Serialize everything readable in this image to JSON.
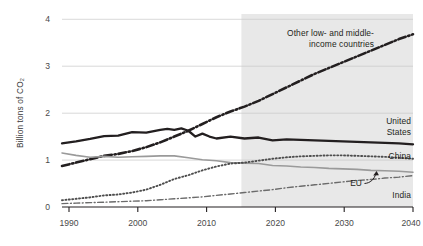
{
  "chart_data": {
    "type": "line",
    "title": "",
    "xlabel": "",
    "ylabel": "Billion tons of CO₂",
    "xlim": [
      1990,
      2040
    ],
    "ylim": [
      0,
      4
    ],
    "yticks": [
      0,
      1,
      2,
      3,
      4
    ],
    "ytick_labels": [
      "0",
      "1",
      "2",
      "3",
      "4"
    ],
    "xticks": [
      1990,
      2000,
      2010,
      2020,
      2030,
      2040
    ],
    "xtick_labels": [
      "1990",
      "2000",
      "2010",
      "2020",
      "2030",
      "2040"
    ],
    "grid": "horizontal",
    "legend_position": "inline-annotations",
    "forecast_start": 2017,
    "forecast_shading": "#e8e8e8",
    "series": [
      {
        "name": "Other low- and middle-income countries",
        "label_lines": [
          "Other low- and middle-",
          "income countries"
        ],
        "style": "dash-dot",
        "color": "#231f20",
        "width": 2.6,
        "x": [
          1990,
          1992,
          1994,
          1996,
          1998,
          2000,
          2002,
          2004,
          2006,
          2008,
          2010,
          2012,
          2014,
          2016,
          2018,
          2020,
          2022,
          2024,
          2026,
          2028,
          2030,
          2032,
          2034,
          2036,
          2038,
          2040
        ],
        "y": [
          0.85,
          0.92,
          0.99,
          1.06,
          1.1,
          1.16,
          1.24,
          1.34,
          1.46,
          1.58,
          1.72,
          1.86,
          1.98,
          2.08,
          2.2,
          2.34,
          2.48,
          2.62,
          2.76,
          2.88,
          3.0,
          3.12,
          3.24,
          3.36,
          3.48,
          3.58
        ]
      },
      {
        "name": "United States",
        "label_lines": [
          "United",
          "States"
        ],
        "style": "solid",
        "color": "#231f20",
        "width": 2.3,
        "x": [
          1990,
          1992,
          1994,
          1996,
          1998,
          2000,
          2002,
          2004,
          2005,
          2006,
          2007,
          2008,
          2009,
          2010,
          2011,
          2012,
          2014,
          2016,
          2018,
          2020,
          2022,
          2024,
          2026,
          2028,
          2030,
          2032,
          2034,
          2036,
          2038,
          2040
        ],
        "y": [
          1.32,
          1.36,
          1.41,
          1.47,
          1.48,
          1.55,
          1.54,
          1.6,
          1.62,
          1.6,
          1.63,
          1.58,
          1.46,
          1.52,
          1.46,
          1.42,
          1.46,
          1.42,
          1.44,
          1.38,
          1.4,
          1.39,
          1.38,
          1.37,
          1.36,
          1.35,
          1.34,
          1.33,
          1.32,
          1.3
        ]
      },
      {
        "name": "EU",
        "label_lines": [
          "EU"
        ],
        "style": "solid",
        "color": "#9a9a9a",
        "width": 1.6,
        "x": [
          1990,
          1992,
          1994,
          1996,
          1998,
          2000,
          2002,
          2004,
          2006,
          2008,
          2010,
          2012,
          2014,
          2016,
          2018,
          2020,
          2022,
          2024,
          2026,
          2028,
          2030,
          2032,
          2034,
          2036,
          2038,
          2040
        ],
        "y": [
          1.12,
          1.07,
          1.03,
          1.05,
          1.03,
          1.04,
          1.05,
          1.06,
          1.06,
          1.02,
          0.98,
          0.96,
          0.92,
          0.91,
          0.9,
          0.86,
          0.85,
          0.83,
          0.82,
          0.8,
          0.79,
          0.78,
          0.76,
          0.75,
          0.74,
          0.72
        ]
      },
      {
        "name": "China",
        "label_lines": [
          "China"
        ],
        "style": "dotted",
        "color": "#4d4d4d",
        "width": 1.9,
        "x": [
          1990,
          1992,
          1994,
          1996,
          1998,
          2000,
          2002,
          2004,
          2006,
          2008,
          2010,
          2012,
          2014,
          2016,
          2018,
          2020,
          2022,
          2024,
          2026,
          2028,
          2030,
          2032,
          2034,
          2036,
          2038,
          2040
        ],
        "y": [
          0.14,
          0.17,
          0.2,
          0.24,
          0.26,
          0.3,
          0.36,
          0.46,
          0.58,
          0.66,
          0.76,
          0.84,
          0.9,
          0.92,
          0.96,
          1.0,
          1.03,
          1.05,
          1.06,
          1.07,
          1.07,
          1.06,
          1.05,
          1.04,
          1.02,
          1.0
        ]
      },
      {
        "name": "India",
        "label_lines": [
          "India"
        ],
        "style": "thin-dash-dot",
        "color": "#6b6b6b",
        "width": 1.4,
        "x": [
          1990,
          1992,
          1994,
          1996,
          1998,
          2000,
          2002,
          2004,
          2006,
          2008,
          2010,
          2012,
          2014,
          2016,
          2018,
          2020,
          2022,
          2024,
          2026,
          2028,
          2030,
          2032,
          2034,
          2036,
          2038,
          2040
        ],
        "y": [
          0.07,
          0.08,
          0.09,
          0.1,
          0.11,
          0.12,
          0.13,
          0.15,
          0.17,
          0.19,
          0.21,
          0.24,
          0.27,
          0.3,
          0.33,
          0.36,
          0.4,
          0.43,
          0.46,
          0.49,
          0.52,
          0.55,
          0.57,
          0.6,
          0.62,
          0.65
        ]
      }
    ],
    "annotations": [
      {
        "id": "other-low-middle",
        "lines": [
          "Other low- and middle-",
          "income countries"
        ],
        "anchor": "end"
      },
      {
        "id": "united-states",
        "lines": [
          "United",
          "States"
        ],
        "anchor": "end"
      },
      {
        "id": "china",
        "lines": [
          "China"
        ],
        "anchor": "end"
      },
      {
        "id": "eu",
        "lines": [
          "EU"
        ],
        "anchor": "end"
      },
      {
        "id": "india",
        "lines": [
          "India"
        ],
        "anchor": "end"
      }
    ]
  },
  "axis": {
    "ylabel": "Billion tons of CO₂",
    "ytick_0": "0",
    "ytick_1": "1",
    "ytick_2": "2",
    "ytick_3": "3",
    "ytick_4": "4",
    "xtick_1990": "1990",
    "xtick_2000": "2000",
    "xtick_2010": "2010",
    "xtick_2020": "2020",
    "xtick_2030": "2030",
    "xtick_2040": "2040"
  },
  "labels": {
    "other_line1": "Other low- and middle-",
    "other_line2": "income countries",
    "us_line1": "United",
    "us_line2": "States",
    "china": "China",
    "eu": "EU",
    "india": "India"
  }
}
